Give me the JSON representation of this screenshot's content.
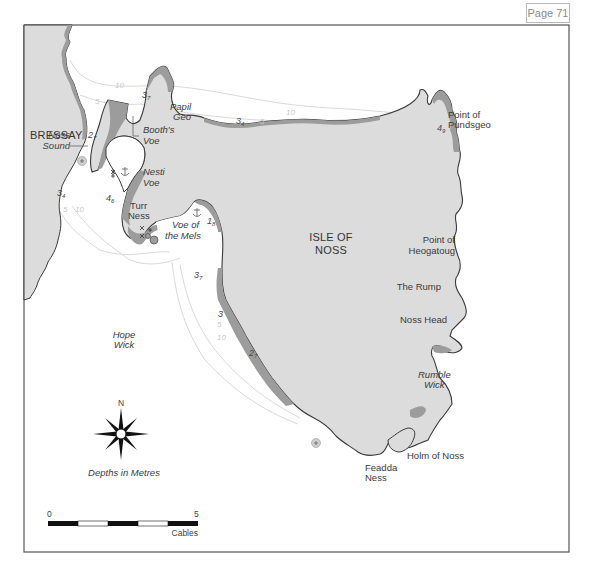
{
  "page_label": "Page 71",
  "map": {
    "island_label": [
      "ISLE OF",
      "NOSS"
    ],
    "bressay_label": "BRESSAY",
    "places": {
      "noss_sound": [
        "Noss",
        "Sound"
      ],
      "booths_voe": [
        "Booth's",
        "Voe"
      ],
      "papil_geo": [
        "Papil",
        "Geo"
      ],
      "nesti_voe": [
        "Nesti",
        "Voe"
      ],
      "turr_ness": [
        "Turr",
        "Ness"
      ],
      "voe_of_the_mels": [
        "Voe of",
        "the Mels"
      ],
      "hope_wick": [
        "Hope",
        "Wick"
      ],
      "point_of_pundsgeo": [
        "Point of",
        "Pundsgeo"
      ],
      "point_of_heogatoug": [
        "Point of",
        "Heogatoug"
      ],
      "the_rump": "The Rump",
      "noss_head": "Noss Head",
      "rumble_wick": [
        "Rumble",
        "Wick"
      ],
      "holm_of_noss": "Holm of Noss",
      "feadda_ness": [
        "Feadda",
        "Ness"
      ]
    },
    "soundings": [
      {
        "id": "s1",
        "main": "3",
        "sub": "7"
      },
      {
        "id": "s2",
        "main": "2",
        "sub": "7"
      },
      {
        "id": "s3",
        "main": "3",
        "sub": "4"
      },
      {
        "id": "s4",
        "main": "3",
        "sub": "4"
      },
      {
        "id": "s5",
        "main": "4",
        "sub": "6"
      },
      {
        "id": "s6",
        "main": "1",
        "sub": "8"
      },
      {
        "id": "s7",
        "main": "3",
        "sub": "7"
      },
      {
        "id": "s8",
        "main": "3",
        "sub": ""
      },
      {
        "id": "s9",
        "main": "2",
        "sub": "7"
      },
      {
        "id": "s10",
        "main": "4",
        "sub": "9"
      }
    ],
    "contours": {
      "c10a": "10",
      "c5a": "5",
      "c10b": "10",
      "c5b": "5",
      "c5c": "5",
      "c10c": "10",
      "c5d": "5",
      "c10d": "10"
    },
    "compass_label": "N",
    "depth_note": "Depths in Metres",
    "scale": {
      "start": "0",
      "end": "5",
      "unit": "Cables"
    },
    "colors": {
      "land": "#dcdcdc",
      "drying": "#9c9c9c",
      "coast": "#3a3a3a",
      "contour": "#d6d6d6",
      "frame": "#555555"
    }
  }
}
